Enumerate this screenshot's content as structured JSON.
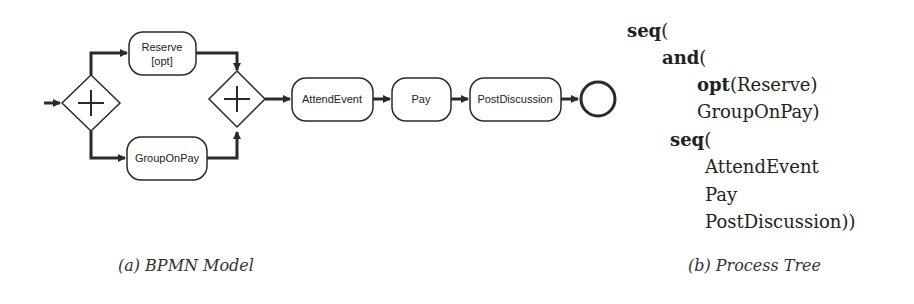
{
  "bpmn": {
    "tasks": {
      "reserve": {
        "line1": "Reserve",
        "line2": "[opt]"
      },
      "group_on_pay": "GroupOnPay",
      "attend_event": "AttendEvent",
      "pay": "Pay",
      "post_discussion": "PostDiscussion"
    },
    "gateways": [
      {
        "type": "parallel-split"
      },
      {
        "type": "parallel-join"
      }
    ],
    "end_event": "end",
    "caption": "(a) BPMN Model"
  },
  "process_tree": {
    "lines": [
      {
        "kw": "seq",
        "rest": "("
      },
      {
        "kw": "and",
        "rest": "("
      },
      {
        "kw": "opt",
        "rest": "(Reserve)"
      },
      {
        "kw": "",
        "rest": "GroupOnPay)"
      },
      {
        "kw": "seq",
        "rest": "("
      },
      {
        "kw": "",
        "rest": "AttendEvent"
      },
      {
        "kw": "",
        "rest": "Pay"
      },
      {
        "kw": "",
        "rest": "PostDiscussion))"
      }
    ],
    "caption": "(b) Process Tree"
  },
  "colors": {
    "stroke": "#2a2a2a",
    "background": "#ffffff"
  }
}
